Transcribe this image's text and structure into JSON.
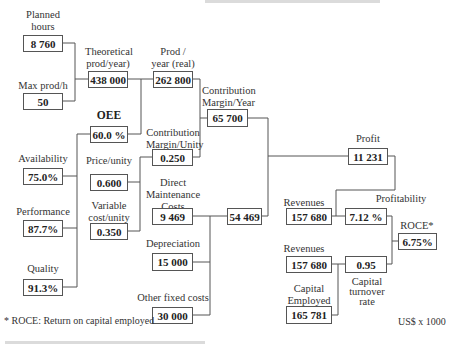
{
  "diagram": {
    "nodes": {
      "planned_hours": {
        "label": "Planned hours",
        "value": "8 760"
      },
      "max_prod_h": {
        "label": "Max prod/h",
        "value": "50"
      },
      "theoretical_prod": {
        "label": "Theoretical prod/year)",
        "value": "438 000"
      },
      "prod_year_real": {
        "label": "Prod / year (real)",
        "value": "262 800"
      },
      "oee": {
        "label": "OEE",
        "value": "60.0 %"
      },
      "availability": {
        "label": "Availability",
        "value": "75.0%"
      },
      "performance": {
        "label": "Performance",
        "value": "87.7%"
      },
      "quality": {
        "label": "Quality",
        "value": "91.3%"
      },
      "price_unity": {
        "label": "Price/unity",
        "value": "0.600"
      },
      "variable_cost_unity": {
        "label": "Variable cost/unity",
        "value": "0.350"
      },
      "contribution_margin_unity": {
        "label": "Contribution Margin/Unity",
        "value": "0.250"
      },
      "contribution_margin_year": {
        "label": "Contribution Margin/Year",
        "value": "65 700"
      },
      "direct_maintenance_costs": {
        "label": "Direct Maintenance Costs",
        "value": "9 469"
      },
      "depreciation": {
        "label": "Depreciation",
        "value": "15 000"
      },
      "other_fixed_costs": {
        "label": "Other fixed costs",
        "value": "30 000"
      },
      "total_fixed_costs": {
        "label": "",
        "value": "54 469"
      },
      "profit": {
        "label": "Profit",
        "value": "11 231"
      },
      "revenues_1": {
        "label": "Revenues",
        "value": "157 680"
      },
      "profitability": {
        "label": "Profitability",
        "value": "7.12 %"
      },
      "revenues_2": {
        "label": "Revenues",
        "value": "157 680"
      },
      "capital_employed": {
        "label": "Capital Employed",
        "value": "165 781"
      },
      "capital_turnover_rate": {
        "label": "Capital turnover rate",
        "value": "0.95"
      },
      "roce": {
        "label": "ROCE*",
        "value": "6.75%"
      }
    },
    "label_lines": {
      "planned_hours": [
        "Planned",
        "hours"
      ],
      "theoretical_prod": [
        "Theoretical",
        "prod/year)"
      ],
      "prod_year_real": [
        "Prod /",
        "year (real)"
      ],
      "contribution_margin_year": [
        "Contribution",
        "Margin/Year"
      ],
      "contribution_margin_unity": [
        "Contribution",
        "Margin/Unity"
      ],
      "variable_cost_unity": [
        "Variable",
        "cost/unity"
      ],
      "direct_maintenance_costs": [
        "Direct",
        "Maintenance",
        "Costs"
      ],
      "capital_employed": [
        "Capital",
        "Employed"
      ],
      "capital_turnover_rate": [
        "Capital",
        "turnover",
        "rate"
      ]
    },
    "footnote": "* ROCE: Return on capital employed",
    "units": "US$ x 1000"
  }
}
